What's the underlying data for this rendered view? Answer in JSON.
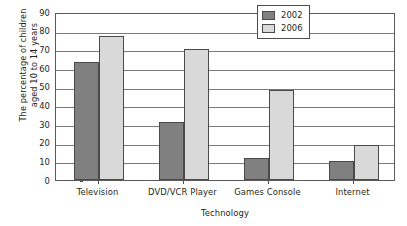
{
  "chart_data": {
    "type": "bar",
    "title": "",
    "subtitle": "",
    "xlabel": "Technology",
    "ylabel": "The percentage of children aged 10 to 14 years",
    "ylabel_lines": [
      "The percentage of children",
      "aged 10 to 14 years"
    ],
    "categories": [
      "Television",
      "DVD/VCR Player",
      "Games Console",
      "Internet"
    ],
    "series": [
      {
        "name": "2002",
        "values": [
          63,
          31,
          12,
          10
        ],
        "color": "#808080"
      },
      {
        "name": "2006",
        "values": [
          77,
          70,
          48,
          19
        ],
        "color": "#d9d9d9"
      }
    ],
    "ylim": [
      0,
      90
    ],
    "ytick_step": 10,
    "yticks": [
      0,
      10,
      20,
      30,
      40,
      50,
      60,
      70,
      80,
      90
    ],
    "ytick_labels": [
      "0",
      "10",
      "20",
      "30",
      "40",
      "50",
      "60",
      "70",
      "80",
      "90"
    ],
    "grid": {
      "horizontal": true,
      "vertical": false
    },
    "legend": {
      "position": "top-right-inside",
      "entries": [
        "2002",
        "2006"
      ]
    },
    "bar_border_color": "#4a4a4a",
    "frame_color": "#5a5a5a",
    "gridline_color": "#7a7a7a",
    "background": "#ffffff"
  }
}
